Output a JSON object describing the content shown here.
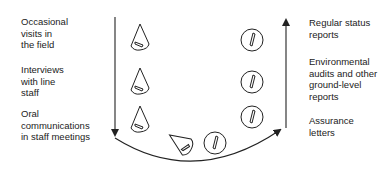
{
  "left_labels": [
    {
      "text": "Occasional\nvisits in\nthe field"
    },
    {
      "text": "Interviews\nwith line\nstaff"
    },
    {
      "text": "Oral\ncommunications\nin staff meetings"
    }
  ],
  "right_labels": [
    {
      "text": "Regular status\nreports"
    },
    {
      "text": "Environmental\naudits and other\nground-level\nreports"
    },
    {
      "text": "Assurance\nletters"
    }
  ],
  "icons": {
    "informal": "cone-icon",
    "formal": "circle-icon"
  },
  "colors": {
    "line": "#222222",
    "background": "#ffffff"
  }
}
